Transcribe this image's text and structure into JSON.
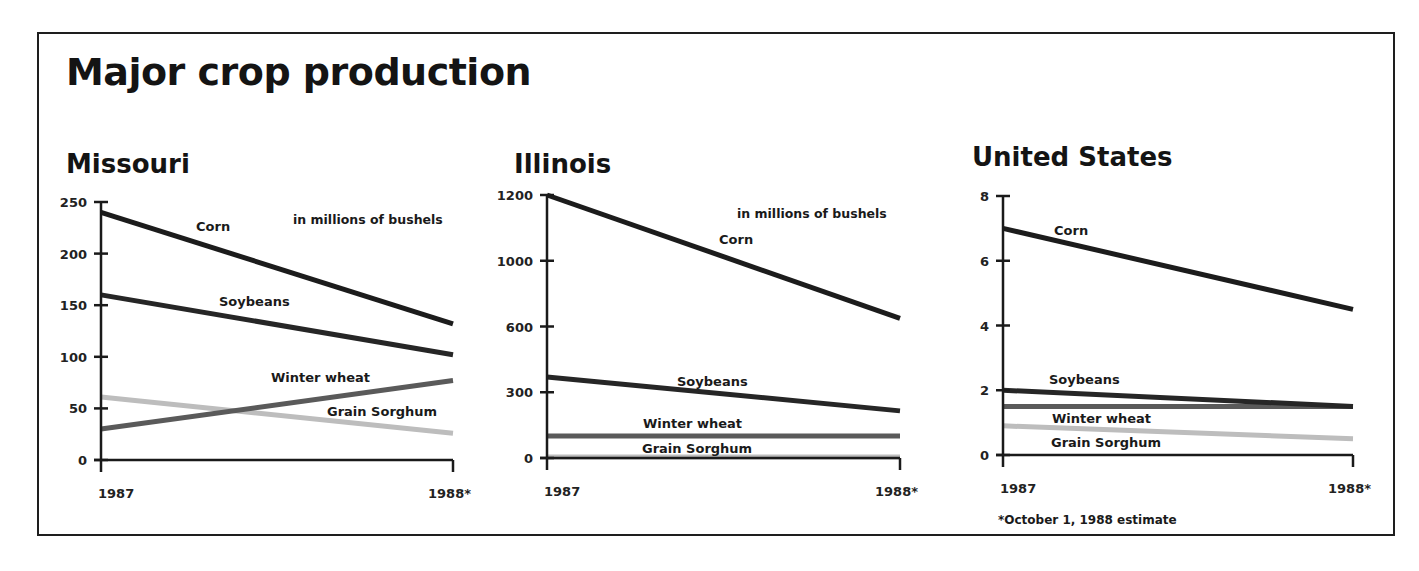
{
  "title": "Major crop production",
  "footnote": "*October 1, 1988 estimate",
  "colors": {
    "corn": "#1c1c1c",
    "soybeans": "#262626",
    "winter_wheat": "#5a5a5a",
    "grain_sorghum": "#bdbdbd",
    "axis": "#1a1a1a"
  },
  "chart_data": [
    {
      "type": "line",
      "title": "Missouri",
      "unit_note": "in millions of bushels",
      "categories": [
        "1987",
        "1988*"
      ],
      "yticks": [
        0,
        50,
        100,
        150,
        200,
        250
      ],
      "ylim": [
        0,
        250
      ],
      "series": [
        {
          "name": "Corn",
          "values": [
            240,
            132
          ]
        },
        {
          "name": "Soybeans",
          "values": [
            160,
            102
          ]
        },
        {
          "name": "Winter wheat",
          "values": [
            30,
            77
          ]
        },
        {
          "name": "Grain Sorghum",
          "values": [
            61,
            26
          ]
        }
      ],
      "grid": false
    },
    {
      "type": "line",
      "title": "Illinois",
      "unit_note": "in millions of bushels",
      "categories": [
        "1987",
        "1988*"
      ],
      "yticks": [
        0,
        300,
        600,
        1000,
        1200
      ],
      "ylim": [
        0,
        1200
      ],
      "series": [
        {
          "name": "Corn",
          "values": [
            1200,
            650
          ]
        },
        {
          "name": "Soybeans",
          "values": [
            370,
            215
          ]
        },
        {
          "name": "Winter wheat",
          "values": [
            100,
            100
          ]
        },
        {
          "name": "Grain Sorghum",
          "values": [
            5,
            5
          ]
        }
      ],
      "grid": false
    },
    {
      "type": "line",
      "title": "United States",
      "unit_note": "",
      "categories": [
        "1987",
        "1988*"
      ],
      "yticks": [
        0,
        2,
        4,
        6,
        8
      ],
      "ylim": [
        0,
        8
      ],
      "series": [
        {
          "name": "Corn",
          "values": [
            7.0,
            4.5
          ]
        },
        {
          "name": "Soybeans",
          "values": [
            2.0,
            1.5
          ]
        },
        {
          "name": "Winter wheat",
          "values": [
            1.5,
            1.5
          ]
        },
        {
          "name": "Grain Sorghum",
          "values": [
            0.9,
            0.5
          ]
        }
      ],
      "grid": false
    }
  ]
}
